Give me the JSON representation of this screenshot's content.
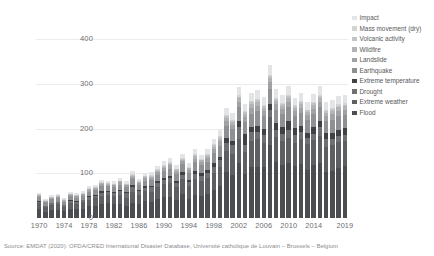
{
  "caption": "Source: EMDAT (2020): OFDA/CRED International Disaster Database, Université catholique de Louvain – Brussels – Belgium",
  "legend": {
    "position": "right",
    "items": [
      {
        "label": "Impact",
        "color": "#e3e4e5"
      },
      {
        "label": "Mass movement (dry)",
        "color": "#d2d3d4"
      },
      {
        "label": "Volcanic activity",
        "color": "#c2c3c5"
      },
      {
        "label": "Wildfire",
        "color": "#b1b3b5"
      },
      {
        "label": "Landslide",
        "color": "#a0a2a5"
      },
      {
        "label": "Earthquake",
        "color": "#8e9093"
      },
      {
        "label": "Extreme temperature",
        "color": "#3f4145"
      },
      {
        "label": "Drought",
        "color": "#6e7073"
      },
      {
        "label": "Extreme weather",
        "color": "#5d5f62"
      },
      {
        "label": "Flood",
        "color": "#4b4d50"
      }
    ]
  },
  "chart_data": {
    "type": "bar",
    "stacked": true,
    "title": "",
    "xlabel": "",
    "ylabel": "",
    "ylim": [
      0,
      430
    ],
    "yticks": [
      0,
      100,
      200,
      300,
      400
    ],
    "ytick_labels": [
      "0",
      "100",
      "200",
      "300",
      "400"
    ],
    "grid": true,
    "xtick_labels": [
      "1970",
      "1974",
      "1978",
      "1982",
      "1986",
      "1990",
      "1994",
      "1998",
      "2002",
      "2006",
      "2010",
      "2014",
      "2019"
    ],
    "categories": [
      "1970",
      "1971",
      "1972",
      "1973",
      "1974",
      "1975",
      "1976",
      "1977",
      "1978",
      "1979",
      "1980",
      "1981",
      "1982",
      "1983",
      "1984",
      "1985",
      "1986",
      "1987",
      "1988",
      "1989",
      "1990",
      "1991",
      "1992",
      "1993",
      "1994",
      "1995",
      "1996",
      "1997",
      "1998",
      "1999",
      "2000",
      "2001",
      "2002",
      "2003",
      "2004",
      "2005",
      "2006",
      "2007",
      "2008",
      "2009",
      "2010",
      "2011",
      "2012",
      "2013",
      "2014",
      "2015",
      "2016",
      "2017",
      "2018",
      "2019"
    ],
    "series": [
      {
        "name": "Flood",
        "color": "#4b4d50",
        "values": [
          20,
          14,
          18,
          19,
          15,
          21,
          20,
          21,
          26,
          27,
          31,
          33,
          31,
          31,
          27,
          34,
          31,
          38,
          36,
          43,
          46,
          48,
          41,
          54,
          43,
          52,
          49,
          54,
          62,
          71,
          104,
          97,
          124,
          99,
          115,
          114,
          115,
          163,
          125,
          118,
          123,
          116,
          122,
          108,
          119,
          124,
          103,
          105,
          111,
          116
        ]
      },
      {
        "name": "Extreme weather",
        "color": "#5d5f62",
        "values": [
          13,
          10,
          11,
          12,
          10,
          13,
          12,
          14,
          15,
          17,
          19,
          18,
          18,
          20,
          18,
          24,
          20,
          22,
          23,
          26,
          30,
          31,
          28,
          33,
          29,
          35,
          33,
          35,
          38,
          44,
          47,
          47,
          54,
          48,
          58,
          62,
          53,
          63,
          56,
          55,
          56,
          53,
          56,
          57,
          56,
          59,
          55,
          59,
          60,
          56
        ]
      },
      {
        "name": "Drought",
        "color": "#6e7073",
        "values": [
          4,
          3,
          4,
          5,
          4,
          5,
          5,
          5,
          6,
          6,
          7,
          7,
          7,
          10,
          11,
          12,
          9,
          8,
          10,
          9,
          9,
          10,
          10,
          10,
          9,
          12,
          12,
          12,
          15,
          14,
          17,
          20,
          26,
          16,
          19,
          17,
          17,
          16,
          17,
          15,
          19,
          16,
          14,
          14,
          14,
          20,
          18,
          14,
          13,
          15
        ]
      },
      {
        "name": "Extreme temperature",
        "color": "#3f4145",
        "values": [
          1,
          1,
          1,
          1,
          1,
          1,
          1,
          1,
          2,
          2,
          3,
          2,
          2,
          2,
          2,
          3,
          2,
          3,
          3,
          4,
          4,
          5,
          4,
          5,
          4,
          6,
          6,
          6,
          8,
          8,
          12,
          9,
          14,
          25,
          11,
          14,
          15,
          14,
          15,
          16,
          20,
          16,
          14,
          12,
          15,
          14,
          15,
          13,
          14,
          15
        ]
      },
      {
        "name": "Earthquake",
        "color": "#8e9093",
        "values": [
          9,
          7,
          8,
          8,
          7,
          9,
          8,
          9,
          10,
          10,
          12,
          11,
          11,
          12,
          11,
          14,
          12,
          13,
          13,
          15,
          16,
          17,
          15,
          18,
          16,
          20,
          18,
          19,
          22,
          25,
          27,
          26,
          30,
          28,
          31,
          32,
          28,
          34,
          30,
          29,
          30,
          28,
          29,
          28,
          29,
          31,
          27,
          29,
          30,
          28
        ]
      },
      {
        "name": "Landslide",
        "color": "#a0a2a5",
        "values": [
          3,
          2,
          3,
          3,
          2,
          3,
          3,
          3,
          4,
          4,
          4,
          4,
          4,
          5,
          4,
          5,
          4,
          5,
          5,
          6,
          6,
          7,
          6,
          7,
          6,
          8,
          7,
          8,
          9,
          10,
          11,
          10,
          12,
          11,
          13,
          13,
          12,
          14,
          12,
          12,
          13,
          11,
          12,
          11,
          12,
          13,
          11,
          12,
          12,
          12
        ]
      },
      {
        "name": "Wildfire",
        "color": "#b1b3b5",
        "values": [
          1,
          1,
          1,
          1,
          1,
          1,
          1,
          1,
          2,
          2,
          2,
          2,
          2,
          2,
          2,
          3,
          2,
          3,
          3,
          3,
          4,
          4,
          3,
          4,
          4,
          5,
          4,
          5,
          6,
          6,
          7,
          6,
          8,
          7,
          8,
          8,
          7,
          9,
          8,
          7,
          8,
          7,
          8,
          7,
          8,
          8,
          7,
          8,
          8,
          8
        ]
      },
      {
        "name": "Volcanic activity",
        "color": "#c2c3c5",
        "values": [
          1,
          1,
          1,
          1,
          1,
          1,
          1,
          1,
          1,
          1,
          1,
          1,
          1,
          1,
          1,
          2,
          1,
          2,
          2,
          2,
          2,
          2,
          2,
          2,
          2,
          3,
          2,
          3,
          3,
          3,
          4,
          3,
          4,
          4,
          4,
          4,
          4,
          5,
          4,
          4,
          4,
          4,
          4,
          4,
          4,
          4,
          4,
          4,
          4,
          4
        ]
      },
      {
        "name": "Mass movement (dry)",
        "color": "#d2d3d4",
        "values": [
          1,
          1,
          1,
          1,
          1,
          1,
          1,
          1,
          1,
          1,
          1,
          1,
          1,
          1,
          1,
          1,
          1,
          1,
          1,
          1,
          1,
          1,
          1,
          1,
          1,
          2,
          1,
          2,
          2,
          2,
          2,
          2,
          3,
          2,
          3,
          3,
          2,
          3,
          3,
          2,
          3,
          2,
          3,
          2,
          3,
          3,
          2,
          3,
          3,
          3
        ]
      },
      {
        "name": "Impact",
        "color": "#e3e4e5",
        "values": [
          4,
          3,
          4,
          4,
          3,
          4,
          4,
          4,
          5,
          5,
          6,
          5,
          6,
          6,
          6,
          7,
          6,
          7,
          7,
          8,
          9,
          9,
          8,
          10,
          9,
          11,
          10,
          11,
          13,
          14,
          16,
          15,
          18,
          16,
          19,
          19,
          18,
          21,
          19,
          18,
          19,
          17,
          18,
          17,
          18,
          19,
          17,
          18,
          18,
          18
        ]
      }
    ]
  }
}
